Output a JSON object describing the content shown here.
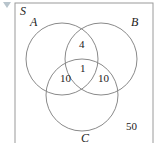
{
  "diagram": {
    "type": "venn",
    "universe_label": "S",
    "sets": [
      {
        "label": "A"
      },
      {
        "label": "B"
      },
      {
        "label": "C"
      }
    ],
    "regions": {
      "A_and_B_only": "4",
      "A_and_B_and_C": "1",
      "A_and_C_only": "10",
      "B_and_C_only": "10",
      "outside": "50"
    },
    "colors": {
      "stroke": "#8a8a8a",
      "text": "#222222"
    }
  }
}
